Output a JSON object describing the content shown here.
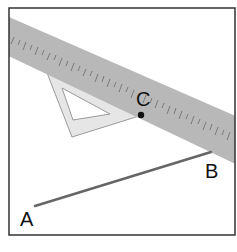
{
  "diagram": {
    "points": {
      "A": {
        "label": "A",
        "x": 35,
        "y": 206
      },
      "B": {
        "label": "B",
        "x": 211,
        "y": 152
      },
      "C": {
        "label": "C",
        "x": 141,
        "y": 115
      }
    },
    "segments": [
      {
        "from": "A",
        "to": "B"
      }
    ],
    "tools": {
      "ruler": {
        "name": "ruler",
        "color": "#b4b4b4"
      },
      "set_square": {
        "name": "set square",
        "color": "#e4e4e4"
      }
    },
    "colors": {
      "line": "#666666",
      "frame": "#333333",
      "point": "#111111"
    }
  }
}
